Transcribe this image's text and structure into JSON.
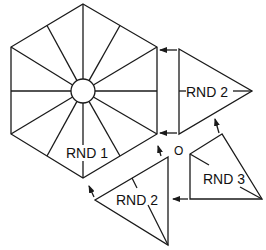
{
  "diagram": {
    "type": "crochet-assembly-diagram",
    "pieces": [
      {
        "id": "hexagon",
        "label": "RND 1",
        "shape": "hexagon with 12 radial spokes and center ring"
      },
      {
        "id": "triangle-right",
        "label": "RND 2",
        "shape": "triangle"
      },
      {
        "id": "triangle-bottom",
        "label": "RND 2",
        "shape": "triangle"
      },
      {
        "id": "triangle-small",
        "label": "RND 3",
        "shape": "triangle"
      }
    ],
    "center_marker": "O",
    "stroke_color": "#1a1a1a",
    "background": "#ffffff"
  }
}
